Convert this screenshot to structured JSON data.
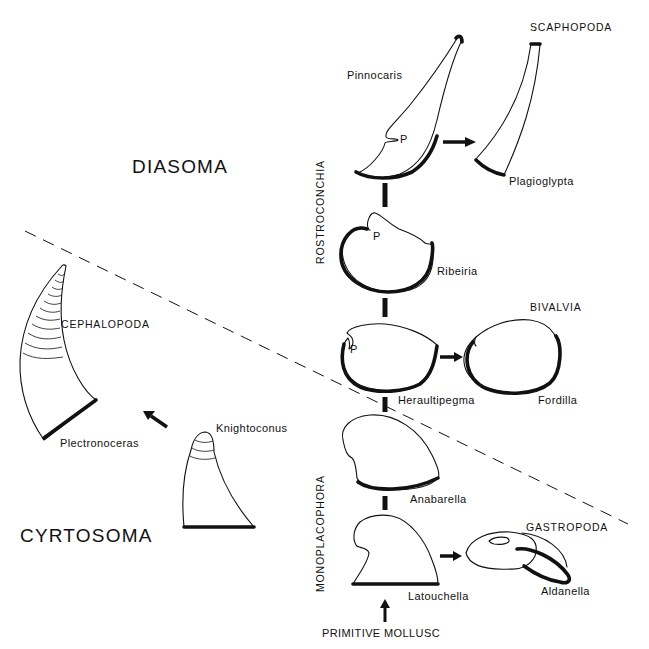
{
  "diagram": {
    "type": "mollusc phylogeny",
    "subphyla": {
      "upper": "DIASOMA",
      "lower": "CYRTOSOMA"
    },
    "class_axis_labels": {
      "upper": "ROSTROCONCHIA",
      "lower": "MONOPLACOPHORA"
    },
    "root": "PRIMITIVE MOLLUSC",
    "classes": {
      "scaphopoda": "SCAPHOPODA",
      "bivalvia": "BIVALVIA",
      "cephalopoda": "CEPHALOPODA",
      "gastropoda": "GASTROPODA"
    },
    "genera": {
      "pinnocaris": "Pinnocaris",
      "plagioglypta": "Plagioglypta",
      "ribeiria": "Ribeiria",
      "heraultipegma": "Heraultipegma",
      "fordilla": "Fordilla",
      "anabarella": "Anabarella",
      "latouchella": "Latouchella",
      "aldanella": "Aldanella",
      "knightoconus": "Knightoconus",
      "plectronoceras": "Plectronoceras"
    },
    "markers": {
      "pegma": "P"
    },
    "colors": {
      "ink": "#111111",
      "background": "#ffffff"
    }
  }
}
